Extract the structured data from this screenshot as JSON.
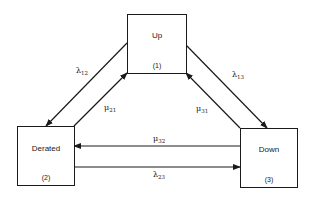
{
  "diagram": {
    "type": "state-transition",
    "states": [
      {
        "id": 1,
        "name": "Up",
        "number": "(1)"
      },
      {
        "id": 2,
        "name": "Derated",
        "number": "(2)"
      },
      {
        "id": 3,
        "name": "Down",
        "number": "(3)"
      }
    ],
    "transitions": [
      {
        "from": 1,
        "to": 2,
        "symbol": "λ",
        "subscript": "12"
      },
      {
        "from": 2,
        "to": 1,
        "symbol": "μ",
        "subscript": "21"
      },
      {
        "from": 1,
        "to": 3,
        "symbol": "λ",
        "subscript": "13"
      },
      {
        "from": 3,
        "to": 1,
        "symbol": "μ",
        "subscript": "31"
      },
      {
        "from": 3,
        "to": 2,
        "symbol": "μ",
        "subscript": "32"
      },
      {
        "from": 2,
        "to": 3,
        "symbol": "λ",
        "subscript": "23"
      }
    ],
    "colors": {
      "stroke": "#1a1a1a",
      "background": "#ffffff"
    }
  }
}
